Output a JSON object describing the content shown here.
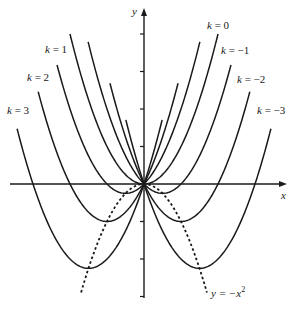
{
  "chart_data": {
    "type": "line",
    "title": "",
    "xlabel": "x",
    "ylabel": "y",
    "xlim": [
      -3.6,
      3.8
    ],
    "ylim": [
      -3.1,
      4.8
    ],
    "grid": false,
    "y_ticks": [
      -3,
      -2,
      -1,
      1,
      2,
      3,
      4
    ],
    "series": [
      {
        "name": "k = 3",
        "k": 3,
        "formula": "y = x^2 + 3x",
        "x_range": [
          -3.43,
          0.49
        ],
        "vertex": [
          -1.5,
          -2.25
        ],
        "style": "solid"
      },
      {
        "name": "k = 2",
        "k": 2,
        "formula": "y = x^2 + 2x",
        "x_range": [
          -2.86,
          0.92
        ],
        "vertex": [
          -1,
          -1
        ],
        "style": "solid"
      },
      {
        "name": "k = 1",
        "k": 1,
        "formula": "y = x^2 + x",
        "x_range": [
          -2.35,
          1.51
        ],
        "vertex": [
          -0.5,
          -0.25
        ],
        "style": "solid"
      },
      {
        "name": "k = 0",
        "k": 0,
        "formula": "y = x^2",
        "x_range": [
          -2.0,
          2.0
        ],
        "vertex": [
          0,
          0
        ],
        "style": "solid"
      },
      {
        "name": "k = −1",
        "k": -1,
        "formula": "y = x^2 - x",
        "x_range": [
          -1.51,
          2.35
        ],
        "vertex": [
          0.5,
          -0.25
        ],
        "style": "solid"
      },
      {
        "name": "k = −2",
        "k": -2,
        "formula": "y = x^2 - 2x",
        "x_range": [
          -0.92,
          2.86
        ],
        "vertex": [
          1,
          -1
        ],
        "style": "solid"
      },
      {
        "name": "k = −3",
        "k": -3,
        "formula": "y = x^2 - 3x",
        "x_range": [
          -0.49,
          3.43
        ],
        "vertex": [
          1.5,
          -2.25
        ],
        "style": "solid"
      },
      {
        "name": "y = −x²",
        "formula": "y = -x^2",
        "x_range": [
          -1.7,
          1.7
        ],
        "style": "dashed"
      }
    ],
    "annotations": [
      {
        "text": "k = 0",
        "pos": [
          208,
          28
        ]
      },
      {
        "text": "k = −1",
        "pos": [
          221,
          53
        ]
      },
      {
        "text": "k = −2",
        "pos": [
          237,
          82
        ]
      },
      {
        "text": "k = −3",
        "pos": [
          257,
          113
        ]
      },
      {
        "text": "k = 1",
        "pos": [
          45,
          52
        ]
      },
      {
        "text": "k = 2",
        "pos": [
          27,
          80
        ]
      },
      {
        "text": "k = 3",
        "pos": [
          7,
          113
        ]
      },
      {
        "text": "y = −x²",
        "pos": [
          211,
          296
        ]
      }
    ]
  },
  "labels": {
    "x_axis": "x",
    "y_axis": "y",
    "k0": "k = 0",
    "km1": "k = −1",
    "km2": "k = −2",
    "km3": "k = −3",
    "k1": "k = 1",
    "k2": "k = 2",
    "k3": "k = 3",
    "dashed_prefix": "y = −x",
    "dashed_exp": "2"
  },
  "colors": {
    "ink": "#1a1a1a",
    "background": "#ffffff"
  }
}
